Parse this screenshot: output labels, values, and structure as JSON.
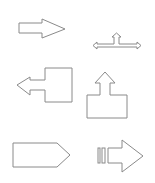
{
  "canvas": {
    "width": 155,
    "height": 183,
    "background": "#ffffff",
    "stroke_color": "#8a8a8a"
  },
  "shapes": [
    {
      "name": "right-arrow",
      "label": "Right Arrow",
      "points": "19,23 42,23 42,19 65,29 42,38 42,33 19,33"
    },
    {
      "name": "left-right-up-arrow",
      "label": "Left-Right-Up Arrow",
      "points": "93,45.5 97,42 97,44 114,44 114,37 112,37 116.5,33 121,37 119,37 119,44 137,44 137,42 141,45.5 137,49 137,47 97,47 97,49"
    },
    {
      "name": "left-arrow-callout",
      "label": "Left Arrow Callout",
      "points": "45,68 72,68 72,102 45,102 45,90 30,90 30,95 17,85 30,77 30,80 45,80"
    },
    {
      "name": "up-arrow-callout",
      "label": "Up Arrow Callout",
      "points": "87,95 100,95 100,83 95,83 105,72 115,83 110,83 110,95 127,95 127,118 87,118"
    },
    {
      "name": "pentagon",
      "label": "Pentagon",
      "points": "13,143 57,143 70,155 57,167 13,167"
    },
    {
      "name": "striped-right-arrow",
      "label": "Striped Right Arrow",
      "points": "108,148 122,148 122,140 143,156 122,172 122,163 108,163",
      "stripes": [
        {
          "x": 98,
          "y": 148,
          "w": 2,
          "h": 15
        },
        {
          "x": 102,
          "y": 148,
          "w": 3,
          "h": 15
        }
      ]
    }
  ]
}
